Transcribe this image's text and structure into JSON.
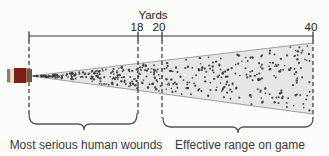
{
  "scale": {
    "title": "Yards",
    "ticks": [
      {
        "label": "18"
      },
      {
        "label": "20"
      },
      {
        "label": "40"
      }
    ]
  },
  "regions": [
    {
      "label": "Most serious human wounds"
    },
    {
      "label": "Effective range on game"
    }
  ],
  "colors": {
    "cone_fill": "#e6e6e4",
    "pellet": "#3a3a38",
    "shell_rim": "#8a7f6c",
    "shell_band": "#e7dfc5",
    "shell_body": "#7c2013",
    "shell_tip": "#6e5747"
  },
  "pellets": {
    "count": 440,
    "seed": 12
  }
}
